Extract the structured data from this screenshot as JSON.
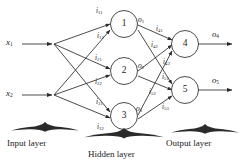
{
  "figure": {
    "stroke_color": "#2b2b2b",
    "background": "#ffffff"
  },
  "captions": {
    "input_layer": "Input layer",
    "hidden_layer": "Hidden layer",
    "output_layer": "Output layer"
  },
  "inputs": [
    {
      "id": "x1",
      "base": "x",
      "sub": "1"
    },
    {
      "id": "x2",
      "base": "x",
      "sub": "2"
    }
  ],
  "hidden_nodes": [
    {
      "id": "n1",
      "label": "1"
    },
    {
      "id": "n2",
      "label": "2"
    },
    {
      "id": "n3",
      "label": "3"
    }
  ],
  "output_nodes": [
    {
      "id": "n4",
      "label": "4"
    },
    {
      "id": "n5",
      "label": "5"
    }
  ],
  "hidden_inputs": [
    {
      "base": "i",
      "sub": "11"
    },
    {
      "base": "i",
      "sub": "12"
    },
    {
      "base": "i",
      "sub": "21"
    },
    {
      "base": "i",
      "sub": "22"
    },
    {
      "base": "i",
      "sub": "31"
    },
    {
      "base": "i",
      "sub": "32"
    }
  ],
  "hidden_outputs": [
    {
      "base": "o",
      "sub": "1"
    },
    {
      "base": "o",
      "sub": "2"
    },
    {
      "base": "o",
      "sub": "3"
    }
  ],
  "output_inputs": [
    {
      "base": "i",
      "sub": "41"
    },
    {
      "base": "i",
      "sub": "42"
    },
    {
      "base": "i",
      "sub": "43"
    },
    {
      "base": "i",
      "sub": "51"
    },
    {
      "base": "i",
      "sub": "52"
    },
    {
      "base": "i",
      "sub": "53"
    }
  ],
  "network_outputs": [
    {
      "base": "o",
      "sub": "4"
    },
    {
      "base": "o",
      "sub": "5"
    }
  ]
}
